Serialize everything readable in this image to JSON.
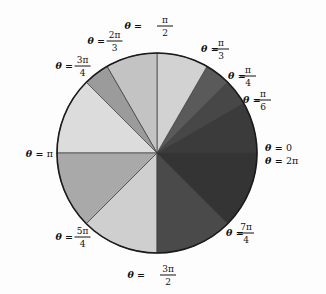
{
  "figure": {
    "background_color": "#fdfdfd",
    "outline_color": "#1a1a1a",
    "sector_edge_color": "#3a3a3a",
    "center": {
      "x": 157,
      "y": 153
    },
    "radius": 100
  },
  "chart_data": {
    "type": "pie",
    "title": "",
    "xlabel": "",
    "ylabel": "",
    "legend_position": "none",
    "grid": false,
    "note": "Circle partitioned at the standard reference angles; each wedge spans from its start angle to its end angle measured counterclockwise from the positive x-axis.",
    "categories": [
      "0 to π/6",
      "π/6 to π/4",
      "π/4 to π/3",
      "π/3 to π/2",
      "π/2 to 2π/3",
      "2π/3 to 3π/4",
      "3π/4 to π",
      "π to 5π/4",
      "5π/4 to 3π/2",
      "3π/2 to 7π/4",
      "7π/4 to 2π"
    ],
    "start_angles_deg": [
      0,
      30,
      45,
      60,
      90,
      120,
      135,
      180,
      225,
      270,
      315
    ],
    "end_angles_deg": [
      30,
      45,
      60,
      90,
      120,
      135,
      180,
      225,
      270,
      315,
      360
    ],
    "values": [
      30,
      15,
      15,
      30,
      30,
      15,
      45,
      45,
      45,
      45,
      45
    ],
    "colors": [
      "#3b3b3b",
      "#474747",
      "#5a5a5a",
      "#d2d2d2",
      "#c3c3c3",
      "#9b9b9b",
      "#dcdcdc",
      "#a9a9a9",
      "#cfcfcf",
      "#4a4a4a",
      "#343434"
    ]
  },
  "labels": [
    {
      "id": "theta-0",
      "theta": "θ =",
      "value": "0",
      "type": "plain",
      "anchor": "start",
      "x": 265,
      "y": 148
    },
    {
      "id": "theta-2pi",
      "theta": "θ =",
      "value": "2π",
      "type": "plain",
      "anchor": "start",
      "x": 265,
      "y": 161
    },
    {
      "id": "theta-pi-6",
      "theta": "θ =",
      "num": "π",
      "den": "6",
      "type": "fraction",
      "anchor": "start",
      "x": 243,
      "y": 100
    },
    {
      "id": "theta-pi-4",
      "theta": "θ =",
      "num": "π",
      "den": "4",
      "type": "fraction",
      "anchor": "start",
      "x": 228,
      "y": 76
    },
    {
      "id": "theta-pi-3",
      "theta": "θ =",
      "num": "π",
      "den": "3",
      "type": "fraction",
      "anchor": "start",
      "x": 201,
      "y": 49
    },
    {
      "id": "theta-pi-2",
      "theta": "θ =",
      "num": "π",
      "den": "2",
      "type": "fraction",
      "anchor": "middle",
      "x": 155,
      "y": 26
    },
    {
      "id": "theta-2pi-3",
      "theta": "θ =",
      "num": "2π",
      "den": "3",
      "type": "fraction",
      "anchor": "end",
      "x": 122,
      "y": 41
    },
    {
      "id": "theta-3pi-4",
      "theta": "θ =",
      "num": "3π",
      "den": "4",
      "type": "fraction",
      "anchor": "end",
      "x": 90,
      "y": 66
    },
    {
      "id": "theta-pi",
      "theta": "θ =",
      "value": "π",
      "type": "plain",
      "anchor": "end",
      "x": 53,
      "y": 154
    },
    {
      "id": "theta-5pi-4",
      "theta": "θ =",
      "num": "5π",
      "den": "4",
      "type": "fraction",
      "anchor": "end",
      "x": 90,
      "y": 237
    },
    {
      "id": "theta-3pi-2",
      "theta": "θ =",
      "num": "3π",
      "den": "2",
      "type": "fraction",
      "anchor": "middle",
      "x": 158,
      "y": 275
    },
    {
      "id": "theta-7pi-4",
      "theta": "θ =",
      "num": "7π",
      "den": "4",
      "type": "fraction",
      "anchor": "start",
      "x": 226,
      "y": 233
    }
  ]
}
